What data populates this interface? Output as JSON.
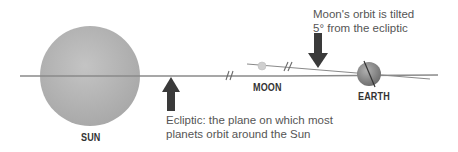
{
  "diagram": {
    "labels": {
      "sun": "SUN",
      "moon": "MOON",
      "earth": "EARTH"
    },
    "annotations": {
      "moon_orbit_line1": "Moon's orbit is tilted",
      "moon_orbit_line2": "5° from the ecliptic",
      "ecliptic_line1": "Ecliptic: the plane on which most",
      "ecliptic_line2": "planets orbit around the Sun"
    },
    "moon_orbit_tilt_degrees": 5,
    "colors": {
      "sun": "#b5b5b5",
      "earth": "#8f8f8f",
      "moon": "#cfcfcf",
      "ecliptic_line": "#8a8a8a",
      "arrow": "#3a3a3a",
      "text": "#555555"
    }
  }
}
